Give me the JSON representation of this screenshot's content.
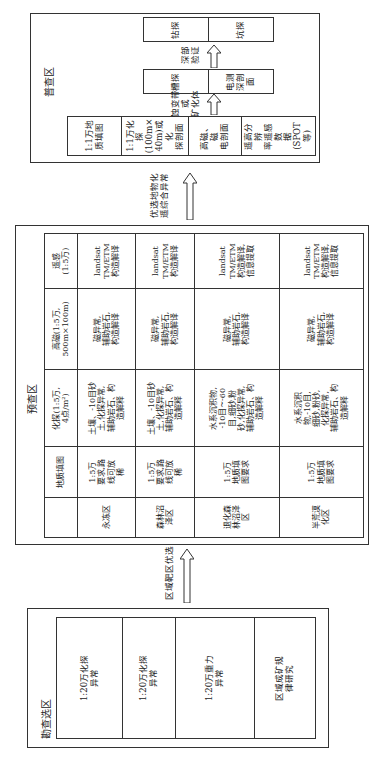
{
  "select_area": {
    "title": "勘查选区",
    "items": [
      "1:20万化探\n异常",
      "1:20万化探\n异常",
      "1:20万重力\n异常",
      "区域成矿规\n律研究"
    ]
  },
  "arrow1": {
    "label": "区域靶区优选"
  },
  "pre_survey": {
    "title": "预查区",
    "headers": [
      "",
      "地质填图",
      "化探(1:5万,\n4点/m²)",
      "高磁(1:5万,\n500m×100m)",
      "遥感\n(1:5万)"
    ],
    "rows": [
      [
        "永冻区",
        "1:5万\n要求,路\n线可放\n稀",
        "土壤、-10目砂\n土,化探异常,\n辅助岩石、构\n造解释",
        "磁异常,\n辅助岩石,\n构造解译",
        "landsat\nTM/ETM\n构造解译"
      ],
      [
        "森林沼\n泽区",
        "1:5万\n要求,路\n线可放\n稀",
        "土壤、-10目砂\n土,化探异常,\n辅助岩石、构\n造解释",
        "磁异常,\n辅助岩石,\n构造解译",
        "landsat\nTM/ETM\n构造解译"
      ],
      [
        "退化森\n林沼泽\n区",
        "1:5万\n地质填\n图要求",
        "水系沉积物,\n-10目~-60\n目,细砂,粉\n砂,化探异常,\n辅助岩石、构\n造解释",
        "磁异常,\n辅助岩石,\n构造解译",
        "landsat\nTM/ETM\n构造解译,\n信息提取"
      ],
      [
        "半荒漠\n化区",
        "1:5万\n地质填\n图要求",
        "水系沉积\n物,-10目,\n细砂,粉砂,\n化探异常,\n辅助岩石、构\n造解释",
        "磁异常,\n辅助岩石,\n构造解译",
        "landsat\nTM/ETM\n构造解译,\n信息提取"
      ]
    ]
  },
  "arrow2": {
    "label": "优选地物化\n遥综合异常"
  },
  "general_survey": {
    "title": "普查区",
    "left_items": [
      "1:1万地\n质填图",
      "1:1万化探\n(100m×\n40m)或化\n探剖面",
      "高磁、磁\n电剖面",
      "遥高分辨\n率遥感数\n据(SPOT\n等)"
    ],
    "arrow_a_label": "蚀变带或\n矿化体",
    "middle_items": [
      "槽探",
      "电测\n深剖\n面"
    ],
    "arrow_b_label": "深部验证",
    "right_items": [
      "钻探",
      "坑探"
    ]
  }
}
